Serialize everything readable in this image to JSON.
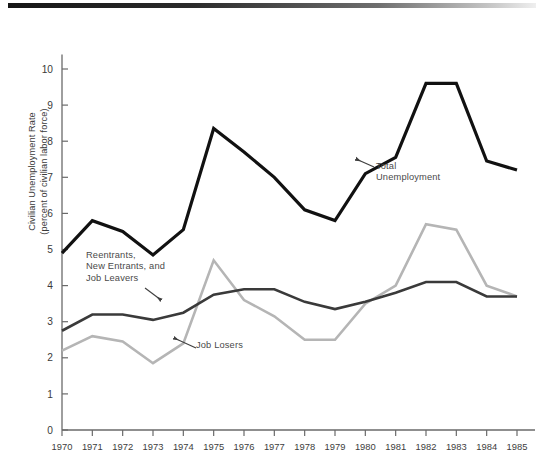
{
  "figure": {
    "ylabel_line1": "Civilian Unemployment Rate",
    "ylabel_line2": "(percent of civilian labor force)",
    "ylabel": "Civilian Unemployment Rate\n(percent of civilian labor force)",
    "annotations": {
      "total": "Total\nUnemployment",
      "total_line1": "Total",
      "total_line2": "Unemployment",
      "reentrants": "Reentrants,\nNew Entrants, and\nJob Leavers",
      "reentrants_line1": "Reentrants,",
      "reentrants_line2": "New Entrants, and",
      "reentrants_line3": "Job Leavers",
      "job_losers": "Job Losers"
    },
    "colors": {
      "total": "#111111",
      "reentrants": "#3a3a3a",
      "job_losers": "#b5b5b5",
      "axis": "#6a6a6a",
      "text": "#3d3d3d",
      "background": "#ffffff",
      "top_rule": "#161616"
    }
  },
  "chart_data": {
    "type": "line",
    "title": "",
    "xlabel": "",
    "ylabel": "Civilian Unemployment Rate (percent of civilian labor force)",
    "x": [
      1970,
      1971,
      1972,
      1973,
      1974,
      1975,
      1976,
      1977,
      1978,
      1979,
      1980,
      1981,
      1982,
      1983,
      1984,
      1985
    ],
    "categories": [
      "1970",
      "1971",
      "1972",
      "1973",
      "1974",
      "1975",
      "1976",
      "1977",
      "1978",
      "1979",
      "1980",
      "1981",
      "1982",
      "1983",
      "1984",
      "1985"
    ],
    "xlim": [
      1970,
      1985
    ],
    "ylim": [
      0,
      10.4
    ],
    "yticks": [
      0,
      1,
      2,
      3,
      4,
      5,
      6,
      7,
      8,
      9,
      10
    ],
    "ytick_labels": [
      "0",
      "1",
      "2",
      "3",
      "4",
      "5",
      "6",
      "7",
      "8",
      "9",
      "10"
    ],
    "grid": false,
    "legend_position": "inline-annotations",
    "series": [
      {
        "name": "Total Unemployment",
        "color": "#111111",
        "width": 3.2,
        "values": [
          4.9,
          5.8,
          5.5,
          4.85,
          5.55,
          8.35,
          7.7,
          7.0,
          6.1,
          5.8,
          7.1,
          7.55,
          9.6,
          9.6,
          7.45,
          7.2
        ]
      },
      {
        "name": "Reentrants, New Entrants, and Job Leavers",
        "color": "#3a3a3a",
        "width": 2.6,
        "values": [
          2.75,
          3.2,
          3.2,
          3.05,
          3.25,
          3.75,
          3.9,
          3.9,
          3.55,
          3.35,
          3.55,
          3.8,
          4.1,
          4.1,
          3.7,
          3.7
        ]
      },
      {
        "name": "Job Losers",
        "color": "#b5b5b5",
        "width": 2.6,
        "values": [
          2.2,
          2.6,
          2.45,
          1.85,
          2.4,
          4.7,
          3.6,
          3.15,
          2.5,
          2.5,
          3.5,
          4.0,
          5.7,
          5.55,
          4.0,
          3.7
        ]
      }
    ],
    "annotations": [
      {
        "text": "Total Unemployment",
        "series": "Total Unemployment",
        "points_to_year": 1981
      },
      {
        "text": "Reentrants, New Entrants, and Job Leavers",
        "series": "Reentrants, New Entrants, and Job Leavers",
        "points_to_year": 1978
      },
      {
        "text": "Job Losers",
        "series": "Job Losers",
        "points_to_year": 1978
      }
    ]
  }
}
